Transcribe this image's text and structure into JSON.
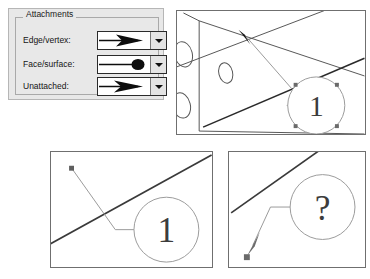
{
  "dialog": {
    "group_label": "Attachments",
    "background_color": "#e8e8e8",
    "fields": [
      {
        "label": "Edge/vertex:",
        "value_icon": "arrow-terminator",
        "name": "edge-vertex"
      },
      {
        "label": "Face/surface:",
        "value_icon": "dot-terminator",
        "name": "face-surface"
      },
      {
        "label": "Unattached:",
        "value_icon": "arrow-terminator",
        "name": "unattached"
      }
    ],
    "dropdown_icon": "chevron-down-icon"
  },
  "panels": [
    {
      "name": "edge-vertex-example",
      "balloon_label": "1",
      "terminator": "arrow-terminator",
      "selected": true,
      "handle_count": 4
    },
    {
      "name": "face-surface-example",
      "balloon_label": "1",
      "terminator": "dot-terminator",
      "selected": true,
      "handle_count": 1
    },
    {
      "name": "unattached-example",
      "balloon_label": "?",
      "terminator": "arrow-terminator",
      "selected": true,
      "handle_count": 1
    }
  ],
  "colors": {
    "dialog_bg": "#e8e8e8",
    "panel_border": "#6f6f6f",
    "geometry_line": "#555555",
    "heavy_line": "#2a2a2a",
    "balloon_line": "#8e8e8e",
    "handle_fill": "#6a6a6a",
    "text": "#141414"
  }
}
